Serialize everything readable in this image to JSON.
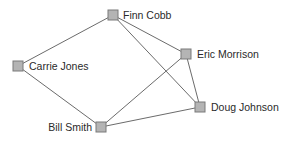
{
  "diagram": {
    "type": "network-graph",
    "background": "#ffffff",
    "colors": {
      "node_fill": "#b4b4b4",
      "node_border": "#7a7a7a",
      "edge": "#6b6b6b",
      "label": "#2a2a2a"
    },
    "nodes": [
      {
        "id": "finn",
        "label": "Finn Cobb",
        "x": 113,
        "y": 15,
        "label_side": "right"
      },
      {
        "id": "carrie",
        "label": "Carrie Jones",
        "x": 18,
        "y": 66,
        "label_side": "right"
      },
      {
        "id": "eric",
        "label": "Eric Morrison",
        "x": 186,
        "y": 54,
        "label_side": "right"
      },
      {
        "id": "doug",
        "label": "Doug Johnson",
        "x": 200,
        "y": 107,
        "label_side": "right"
      },
      {
        "id": "bill",
        "label": "Bill Smith",
        "x": 101,
        "y": 127,
        "label_side": "left"
      }
    ],
    "edges": [
      {
        "from": "finn",
        "to": "carrie"
      },
      {
        "from": "finn",
        "to": "eric"
      },
      {
        "from": "finn",
        "to": "doug"
      },
      {
        "from": "carrie",
        "to": "bill"
      },
      {
        "from": "bill",
        "to": "eric"
      },
      {
        "from": "bill",
        "to": "doug"
      },
      {
        "from": "eric",
        "to": "doug"
      }
    ]
  }
}
